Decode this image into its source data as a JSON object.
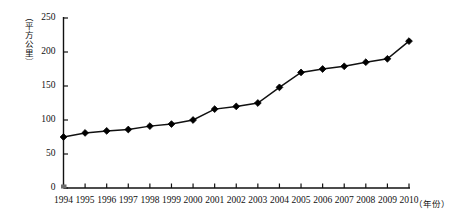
{
  "chart_data": {
    "type": "line",
    "title": "",
    "xlabel": "（年份）",
    "ylabel": "（平方公里）",
    "categories": [
      "1994",
      "1995",
      "1996",
      "1997",
      "1998",
      "1999",
      "2000",
      "2001",
      "2002",
      "2003",
      "2004",
      "2005",
      "2006",
      "2007",
      "2008",
      "2009",
      "2010"
    ],
    "values": [
      75,
      81,
      84,
      86,
      91,
      94,
      100,
      116,
      120,
      125,
      148,
      170,
      175,
      179,
      185,
      190,
      216
    ],
    "series": [
      {
        "name": "建成区面积",
        "values": [
          75,
          81,
          84,
          86,
          91,
          94,
          100,
          116,
          120,
          125,
          148,
          170,
          175,
          179,
          185,
          190,
          216
        ]
      }
    ],
    "ylim": [
      0,
      250
    ],
    "yticks": [
      0,
      50,
      100,
      150,
      200,
      250
    ],
    "ytick_labels": [
      "0",
      "50",
      "100",
      "150",
      "200",
      "250"
    ],
    "grid": false,
    "legend": "none",
    "marker": "diamond",
    "line_color": "#111111",
    "marker_color": "#000000"
  },
  "axes": {
    "y_axis_label": "（平方公里）",
    "x_axis_label": "（年份）",
    "y_tick_labels": [
      "250",
      "200",
      "150",
      "100",
      "50",
      "0"
    ],
    "x_tick_labels": [
      "1994",
      "1995",
      "1996",
      "1997",
      "1998",
      "1999",
      "2000",
      "2001",
      "2002",
      "2003",
      "2004",
      "2005",
      "2006",
      "2007",
      "2008",
      "2009",
      "2010"
    ]
  },
  "colors": {
    "background": "#ffffff",
    "axis": "#111111",
    "line": "#111111",
    "marker": "#000000",
    "text": "#111111"
  }
}
